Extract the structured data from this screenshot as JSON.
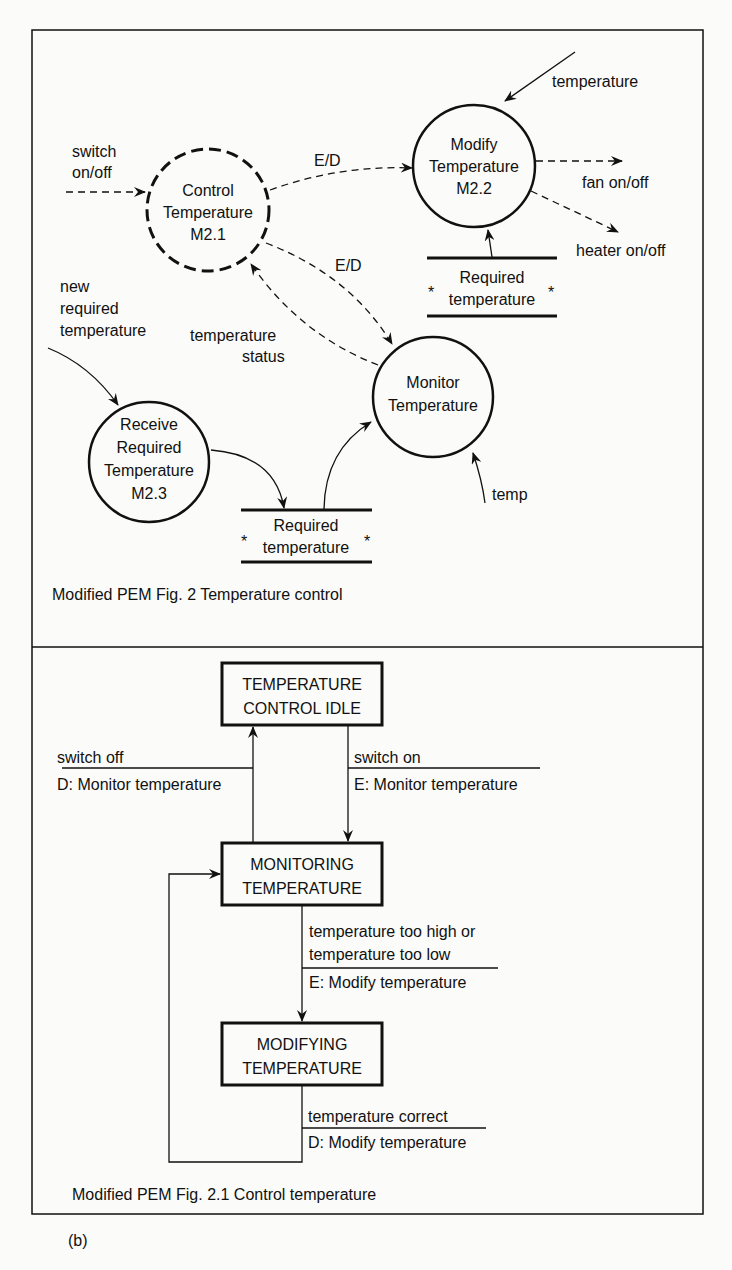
{
  "dfd": {
    "caption": "Modified PEM Fig. 2  Temperature control",
    "processes": {
      "control": {
        "lines": [
          "Control",
          "Temperature",
          "M2.1"
        ],
        "style": "dashed"
      },
      "modify": {
        "lines": [
          "Modify",
          "Temperature",
          "M2.2"
        ],
        "style": "solid"
      },
      "monitor": {
        "lines": [
          "Monitor",
          "Temperature"
        ],
        "style": "solid"
      },
      "receive": {
        "lines": [
          "Receive",
          "Required",
          "Temperature",
          "M2.3"
        ],
        "style": "solid"
      }
    },
    "stores": {
      "top": {
        "line1": "Required",
        "line2": "temperature",
        "marker": "*"
      },
      "bottom": {
        "line1": "Required",
        "line2": "temperature",
        "marker": "*"
      }
    },
    "flows": {
      "switch": [
        "switch",
        "on/off"
      ],
      "ed_top": "E/D",
      "ed_mid": "E/D",
      "temperature_in": "temperature",
      "fan": "fan on/off",
      "heater": "heater on/off",
      "new_required": [
        "new",
        "required",
        "temperature"
      ],
      "temp_status": [
        "temperature",
        "status"
      ],
      "temp": "temp"
    }
  },
  "std": {
    "caption": "Modified PEM Fig. 2.1  Control temperature",
    "states": {
      "idle": [
        "TEMPERATURE",
        "CONTROL IDLE"
      ],
      "monitoring": [
        "MONITORING",
        "TEMPERATURE"
      ],
      "modifying": [
        "MODIFYING",
        "TEMPERATURE"
      ]
    },
    "transitions": {
      "switch_off": {
        "condition": "switch off",
        "action": "D: Monitor temperature"
      },
      "switch_on": {
        "condition": "switch on",
        "action": "E: Monitor temperature"
      },
      "too_high_low": {
        "condition": [
          "temperature too high or",
          "temperature too low"
        ],
        "action": "E: Modify temperature"
      },
      "correct": {
        "condition": "temperature correct",
        "action": "D: Modify temperature"
      }
    }
  },
  "figure_label": "(b)"
}
